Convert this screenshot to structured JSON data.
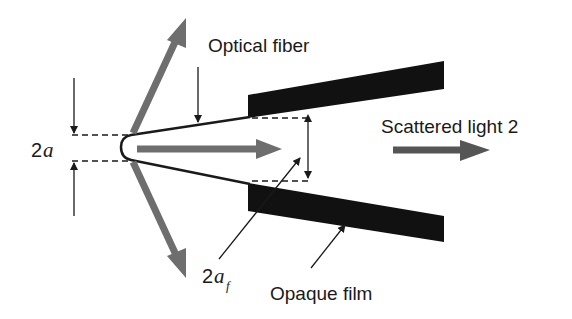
{
  "diagram": {
    "labels": {
      "optical_fiber": "Optical fiber",
      "scattered_light": "Scattered light 2",
      "opaque_film": "Opaque film",
      "tip_diameter_num": "2",
      "tip_diameter_var": "a",
      "aperture_num": "2",
      "aperture_var": "a",
      "aperture_sub": "f"
    },
    "colors": {
      "film": "#111111",
      "light_arrow": "#6e6e6e",
      "line": "#1a1a1a",
      "background": "#ffffff"
    }
  }
}
